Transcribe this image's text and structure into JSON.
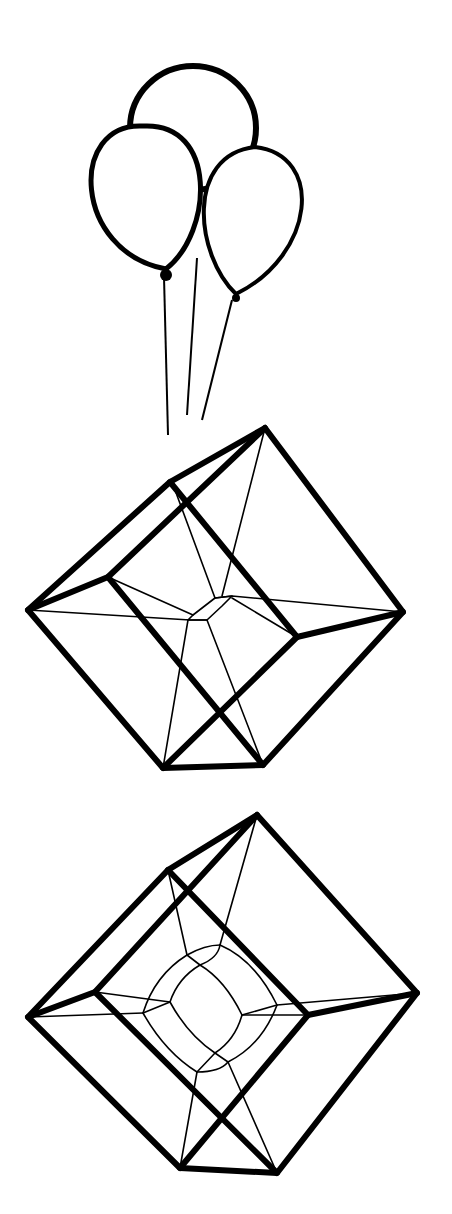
{
  "illustration": {
    "background": "#ffffff",
    "ink": "#000000",
    "figures": [
      "balloons",
      "hypercube-1",
      "hypercube-2"
    ]
  },
  "balloons": {
    "top": {
      "cx": 193,
      "cy": 128,
      "rx": 63,
      "ry": 62,
      "stroke": 6
    },
    "left": {
      "cx": 143,
      "cy": 192,
      "rx": 62,
      "ry": 66,
      "knot": [
        166,
        275
      ],
      "stroke": 5
    },
    "right": {
      "cx": 255,
      "cy": 215,
      "rx": 56,
      "ry": 68,
      "knot": [
        236,
        298
      ],
      "stroke": 4
    },
    "strings": [
      [
        [
          164,
          277
        ],
        [
          168,
          435
        ]
      ],
      [
        [
          197,
          258
        ],
        [
          187,
          415
        ]
      ],
      [
        [
          232,
          300
        ],
        [
          202,
          420
        ]
      ]
    ]
  },
  "cube1": {
    "thick_paths": [
      "M265,428 L403,612 L263,765 L163,768 L28,610 L170,482 L265,428",
      "M170,482 L297,637 L403,612",
      "M265,428 L108,577 L28,610",
      "M108,577 L263,765",
      "M297,637 L163,768"
    ],
    "thin_paths": [
      "M28,610 L190,620 L207,620",
      "M403,612 L232,596 L215,598",
      "M265,428 L222,596",
      "M175,490 L215,598",
      "M108,577 L193,615",
      "M297,637 L232,598",
      "M163,768 L188,620",
      "M263,765 L207,620",
      "M215,598 L232,596 L222,606 L207,620 L188,620 L193,615 Z"
    ]
  },
  "cube2": {
    "thick_paths": [
      "M257,815 L417,993 L277,1173 L180,1168 L28,1017 L168,870 L257,815",
      "M168,870 L308,1015 L417,993",
      "M257,815 L95,992 L28,1017",
      "M95,992 L277,1173",
      "M308,1015 L180,1168"
    ],
    "thin_paths": [
      "M28,1017 L143,1013",
      "M417,993 L277,1005",
      "M257,815 L220,945",
      "M168,870 L187,955",
      "M95,992 L170,1002",
      "M308,1015 L242,1015",
      "M180,1168 L197,1072",
      "M277,1173 L228,1062",
      "M187,955 Q155,975 143,1013 Q165,1052 197,1072 Q220,1072 228,1062",
      "M220,945 Q255,960 277,1005 Q262,1045 228,1062",
      "M187,955 Q205,945 220,945",
      "M200,965 Q178,978 170,1002 Q188,1035 215,1053 Q235,1040 242,1015 Q225,980 200,965",
      "M187,955 L200,965",
      "M220,945 Q218,958 200,965",
      "M143,1013 L170,1002",
      "M197,1072 L215,1053",
      "M277,1005 L242,1015",
      "M228,1062 L215,1053"
    ]
  }
}
